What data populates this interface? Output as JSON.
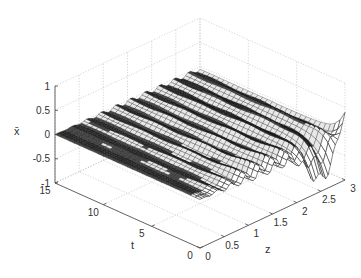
{
  "chart_data": {
    "type": "surface3d",
    "title": "",
    "xlabel": "z",
    "ylabel": "t",
    "zlabel": "x̄",
    "xlim": [
      0,
      3
    ],
    "ylim": [
      0,
      15
    ],
    "zlim": [
      -1,
      1
    ],
    "x_ticks": [
      "0",
      "0.5",
      "1",
      "1.5",
      "2",
      "2.5",
      "3"
    ],
    "y_ticks": [
      "0",
      "5",
      "10",
      "15"
    ],
    "z_ticks": [
      "-1",
      "-0.5",
      "0",
      "0.5",
      "1"
    ],
    "grid": true,
    "colormap": "gray",
    "approx_ripple_amplitude": 0.2,
    "approx_ripple_count": 10
  },
  "labels": {
    "zlabel": "x̄",
    "tlabel": "t",
    "xlabel": "z"
  }
}
